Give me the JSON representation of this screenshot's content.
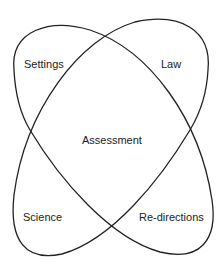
{
  "diagram": {
    "type": "venn-4-region",
    "labels": {
      "top_left": "Settings",
      "top_right": "Law",
      "center": "Assessment",
      "bottom_left": "Science",
      "bottom_right": "Re-directions"
    },
    "stroke_color": "#222222"
  }
}
